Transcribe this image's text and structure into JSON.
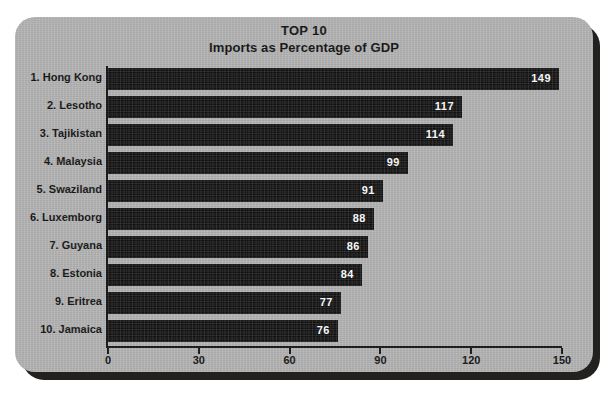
{
  "chart_data": {
    "type": "bar",
    "orientation": "horizontal",
    "title": "TOP 10",
    "subtitle": "Imports as Percentage of GDP",
    "xlabel": "Percent",
    "ylabel": "",
    "xlim": [
      0,
      150
    ],
    "xticks": [
      "0",
      "30",
      "60",
      "90",
      "120",
      "150"
    ],
    "xtick_values": [
      0,
      30,
      60,
      90,
      120,
      150
    ],
    "grid": false,
    "legend": false,
    "categories": [
      "1. Hong Kong",
      "2. Lesotho",
      "3. Tajikistan",
      "4. Malaysia",
      "5. Swaziland",
      "6. Luxemborg",
      "7. Guyana",
      "8. Estonia",
      "9. Eritrea",
      "10. Jamaica"
    ],
    "values": [
      149,
      117,
      114,
      99,
      91,
      88,
      86,
      84,
      77,
      76
    ],
    "value_labels": [
      "149",
      "117",
      "114",
      "99",
      "91",
      "88",
      "86",
      "84",
      "77",
      "76"
    ]
  },
  "colors": {
    "panel_background": "#b4b4b4",
    "bar": "#131313",
    "text": "#131313",
    "value_text": "#ffffff",
    "axis": "#161616",
    "shadow": "#23211f",
    "page_background": "#ffffff"
  }
}
